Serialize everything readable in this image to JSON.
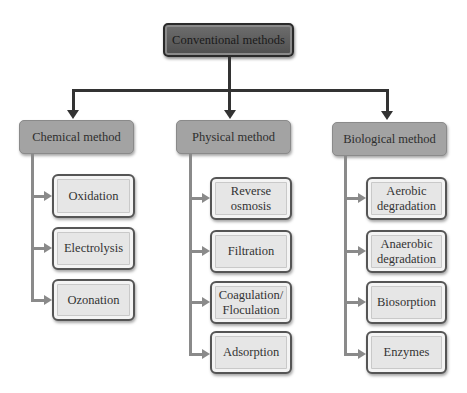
{
  "diagram": {
    "type": "hierarchy",
    "root": {
      "label": "Conventional methods"
    },
    "categories": [
      {
        "label": "Chemical method",
        "children": [
          "Oxidation",
          "Electrolysis",
          "Ozonation"
        ]
      },
      {
        "label": "Physical method",
        "children": [
          "Reverse\nosmosis",
          "Filtration",
          "Coagulation/\nFloculation",
          "Adsorption"
        ]
      },
      {
        "label": "Biological method",
        "children": [
          "Aerobic\ndegradation",
          "Anaerobic\ndegradation",
          "Biosorption",
          "Enzymes"
        ]
      }
    ],
    "colors": {
      "root_fill": "#5e5e5e",
      "category_fill": "#a3a3a3",
      "leaf_fill": "#e6e6e6",
      "connector_dark": "#333333",
      "connector_gray": "#8a8a8a"
    }
  }
}
